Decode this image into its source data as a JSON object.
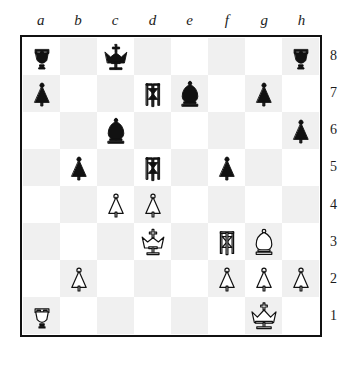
{
  "board": {
    "files": [
      "a",
      "b",
      "c",
      "d",
      "e",
      "f",
      "g",
      "h"
    ],
    "ranks": [
      "8",
      "7",
      "6",
      "5",
      "4",
      "3",
      "2",
      "1"
    ],
    "light_square_color": "#ffffff",
    "dark_square_color": "#f0f0f0",
    "border_color": "#111111",
    "label_color": "#1c1c1c",
    "white_piece_fill": "#ffffff",
    "white_piece_stroke": "#111111",
    "black_piece_fill": "#111111",
    "black_piece_stroke": "#111111",
    "orientation": "white-bottom",
    "rows": [
      [
        {
          "square": "a8",
          "piece": "black-rook",
          "label": "Black Rook"
        },
        {
          "square": "b8",
          "piece": null,
          "label": ""
        },
        {
          "square": "c8",
          "piece": "black-king",
          "label": "Black King"
        },
        {
          "square": "d8",
          "piece": null,
          "label": ""
        },
        {
          "square": "e8",
          "piece": null,
          "label": ""
        },
        {
          "square": "f8",
          "piece": null,
          "label": ""
        },
        {
          "square": "g8",
          "piece": null,
          "label": ""
        },
        {
          "square": "h8",
          "piece": "black-rook",
          "label": "Black Rook"
        }
      ],
      [
        {
          "square": "a7",
          "piece": "black-pawn",
          "label": "Black Pawn"
        },
        {
          "square": "b7",
          "piece": null,
          "label": ""
        },
        {
          "square": "c7",
          "piece": null,
          "label": ""
        },
        {
          "square": "d7",
          "piece": "black-knight",
          "label": "Black Knight"
        },
        {
          "square": "e7",
          "piece": "black-bishop",
          "label": "Black Bishop"
        },
        {
          "square": "f7",
          "piece": null,
          "label": ""
        },
        {
          "square": "g7",
          "piece": "black-pawn",
          "label": "Black Pawn"
        },
        {
          "square": "h7",
          "piece": null,
          "label": ""
        }
      ],
      [
        {
          "square": "a6",
          "piece": null,
          "label": ""
        },
        {
          "square": "b6",
          "piece": null,
          "label": ""
        },
        {
          "square": "c6",
          "piece": "black-bishop",
          "label": "Black Bishop"
        },
        {
          "square": "d6",
          "piece": null,
          "label": ""
        },
        {
          "square": "e6",
          "piece": null,
          "label": ""
        },
        {
          "square": "f6",
          "piece": null,
          "label": ""
        },
        {
          "square": "g6",
          "piece": null,
          "label": ""
        },
        {
          "square": "h6",
          "piece": "black-pawn",
          "label": "Black Pawn"
        }
      ],
      [
        {
          "square": "a5",
          "piece": null,
          "label": ""
        },
        {
          "square": "b5",
          "piece": "black-pawn",
          "label": "Black Pawn"
        },
        {
          "square": "c5",
          "piece": null,
          "label": ""
        },
        {
          "square": "d5",
          "piece": "black-knight",
          "label": "Black Knight"
        },
        {
          "square": "e5",
          "piece": null,
          "label": ""
        },
        {
          "square": "f5",
          "piece": "black-pawn",
          "label": "Black Pawn"
        },
        {
          "square": "g5",
          "piece": null,
          "label": ""
        },
        {
          "square": "h5",
          "piece": null,
          "label": ""
        }
      ],
      [
        {
          "square": "a4",
          "piece": null,
          "label": ""
        },
        {
          "square": "b4",
          "piece": null,
          "label": ""
        },
        {
          "square": "c4",
          "piece": "white-pawn",
          "label": "White Pawn"
        },
        {
          "square": "d4",
          "piece": "white-pawn",
          "label": "White Pawn"
        },
        {
          "square": "e4",
          "piece": null,
          "label": ""
        },
        {
          "square": "f4",
          "piece": null,
          "label": ""
        },
        {
          "square": "g4",
          "piece": null,
          "label": ""
        },
        {
          "square": "h4",
          "piece": null,
          "label": ""
        }
      ],
      [
        {
          "square": "a3",
          "piece": null,
          "label": ""
        },
        {
          "square": "b3",
          "piece": null,
          "label": ""
        },
        {
          "square": "c3",
          "piece": null,
          "label": ""
        },
        {
          "square": "d3",
          "piece": "white-king",
          "label": "White King"
        },
        {
          "square": "e3",
          "piece": null,
          "label": ""
        },
        {
          "square": "f3",
          "piece": "white-knight",
          "label": "White Knight"
        },
        {
          "square": "g3",
          "piece": "white-bishop",
          "label": "White Bishop"
        },
        {
          "square": "h3",
          "piece": null,
          "label": ""
        }
      ],
      [
        {
          "square": "a2",
          "piece": null,
          "label": ""
        },
        {
          "square": "b2",
          "piece": "white-pawn",
          "label": "White Pawn"
        },
        {
          "square": "c2",
          "piece": null,
          "label": ""
        },
        {
          "square": "d2",
          "piece": null,
          "label": ""
        },
        {
          "square": "e2",
          "piece": null,
          "label": ""
        },
        {
          "square": "f2",
          "piece": "white-pawn",
          "label": "White Pawn"
        },
        {
          "square": "g2",
          "piece": "white-pawn",
          "label": "White Pawn"
        },
        {
          "square": "h2",
          "piece": "white-pawn",
          "label": "White Pawn"
        }
      ],
      [
        {
          "square": "a1",
          "piece": "white-rook",
          "label": "White Rook"
        },
        {
          "square": "b1",
          "piece": null,
          "label": ""
        },
        {
          "square": "c1",
          "piece": null,
          "label": ""
        },
        {
          "square": "d1",
          "piece": null,
          "label": ""
        },
        {
          "square": "e1",
          "piece": null,
          "label": ""
        },
        {
          "square": "f1",
          "piece": null,
          "label": ""
        },
        {
          "square": "g1",
          "piece": "white-queen",
          "label": "White Queen"
        },
        {
          "square": "h1",
          "piece": null,
          "label": ""
        }
      ]
    ]
  }
}
